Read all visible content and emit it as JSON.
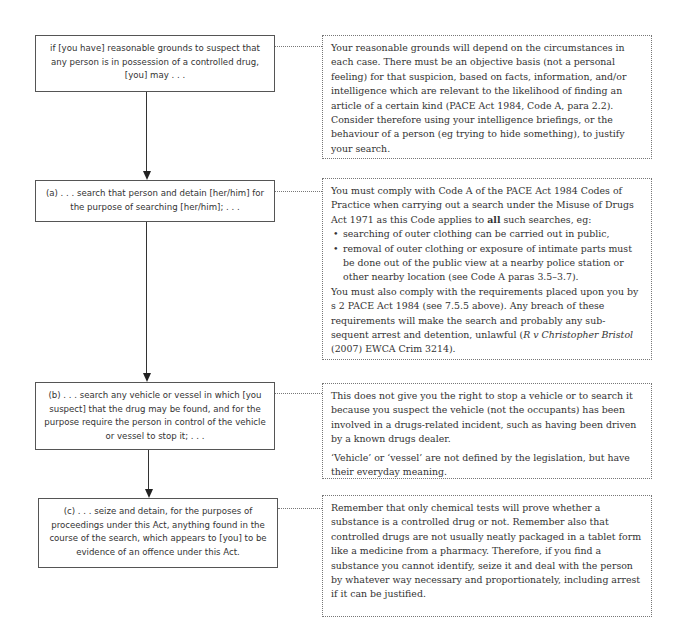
{
  "flow": {
    "steps": [
      {
        "label": "if [you have] reasonable grounds to suspect that any person is in possession of a controlled drug, [you] may . . ."
      },
      {
        "label": "(a) . . . search that person and detain [her/him] for the purpose of searching [her/him]; . . ."
      },
      {
        "label": "(b) . . . search any vehicle or vessel in which [you suspect] that the drug may be found, and for the purpose require the person in control of the vehicle or vessel to stop it; . . ."
      },
      {
        "label": "(c) . . . seize and detain, for the purposes of proceedings under this Act, anything found in the course of the search, which appears to [you] to be evidence of an offence under this Act."
      }
    ]
  },
  "notes": [
    {
      "paragraphs": [
        "Your reasonable grounds will depend on the circumstances in each case. There must be an objective basis (not a personal feeling) for that suspicion, based on facts, information, and/or intelligence which are relevant to the likelihood of finding an article of a certain kind (PACE Act 1984, Code A, para 2.2). Consider therefore using your intelligence briefings, or the behaviour of a person (eg trying to hide something), to justify your search."
      ]
    },
    {
      "intro_before_bold": "You must comply with Code A of the PACE Act 1984 Codes of Practice when carrying out a search under the Misuse of Drugs Act 1971 as this Code applies to ",
      "intro_bold": "all",
      "intro_after_bold": " such searches, eg:",
      "bullets": [
        "searching of outer clothing can be carried out in public,",
        "removal of outer clothing or exposure of intimate parts must be done out of the public view at a nearby police station or other nearby location (see Code A paras 3.5–3.7)."
      ],
      "outro_before_italic": "You must also comply with the requirements placed upon you by s 2 PACE Act 1984 (see 7.5.5 above). Any breach of these requirements will make the search and probably any sub-sequent arrest and detention, unlawful (",
      "outro_italic": "R v Christopher Bristol",
      "outro_after_italic": " (2007) EWCA Crim 3214)."
    },
    {
      "paragraphs": [
        "This does not give you the right to stop a vehicle or to search it because you suspect the vehicle (not the occupants) has been involved in a drugs-related incident, such as having been driven by a known drugs dealer.",
        "‘Vehicle’ or ‘vessel’ are not defined by the legislation, but have their everyday meaning."
      ]
    },
    {
      "paragraphs": [
        "Remember that only chemical tests will prove whether a substance is a controlled drug or not. Remember also that controlled drugs are not usually neatly packaged in a tablet form like a medicine from a pharmacy. Therefore, if you find a substance you cannot identify, seize it and deal with the person by whatever way necessary and proportionately, including arrest if it can be justified."
      ]
    }
  ]
}
